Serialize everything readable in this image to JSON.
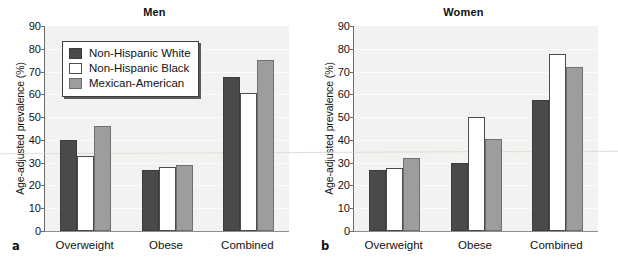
{
  "figure": {
    "panels": [
      {
        "letter": "a",
        "title": "Men"
      },
      {
        "letter": "b",
        "title": "Women"
      }
    ],
    "ylabel": "Age-adjusted prevalence (%)",
    "legend": [
      {
        "label": "Non-Hispanic White",
        "color": "#4a4a4a"
      },
      {
        "label": "Non-Hispanic Black",
        "color": "#ffffff"
      },
      {
        "label": "Mexican-American",
        "color": "#9d9d9d"
      }
    ]
  },
  "chart_data": [
    {
      "type": "bar",
      "title": "Men",
      "panel_letter": "a",
      "categories": [
        "Overweight",
        "Obese",
        "Combined"
      ],
      "series": [
        {
          "name": "Non-Hispanic White",
          "color": "#4a4a4a",
          "values": [
            40,
            27,
            67.5
          ]
        },
        {
          "name": "Non-Hispanic Black",
          "color": "#ffffff",
          "values": [
            33,
            28,
            60.5
          ]
        },
        {
          "name": "Mexican-American",
          "color": "#9d9d9d",
          "values": [
            46,
            29,
            75
          ]
        }
      ],
      "xlabel": "",
      "ylabel": "Age-adjusted prevalence (%)",
      "ylim": [
        0,
        90
      ],
      "yticks": [
        0,
        10,
        20,
        30,
        40,
        50,
        60,
        70,
        80,
        90
      ],
      "grid": true,
      "legend_position": "upper-left"
    },
    {
      "type": "bar",
      "title": "Women",
      "panel_letter": "b",
      "categories": [
        "Overweight",
        "Obese",
        "Combined"
      ],
      "series": [
        {
          "name": "Non-Hispanic White",
          "color": "#4a4a4a",
          "values": [
            27,
            30,
            57.5
          ]
        },
        {
          "name": "Non-Hispanic Black",
          "color": "#ffffff",
          "values": [
            27.5,
            50,
            77.5
          ]
        },
        {
          "name": "Mexican-American",
          "color": "#9d9d9d",
          "values": [
            32,
            40.5,
            72
          ]
        }
      ],
      "xlabel": "",
      "ylabel": "Age-adjusted prevalence (%)",
      "ylim": [
        0,
        90
      ],
      "yticks": [
        0,
        10,
        20,
        30,
        40,
        50,
        60,
        70,
        80,
        90
      ],
      "grid": false,
      "legend_position": "none"
    }
  ]
}
